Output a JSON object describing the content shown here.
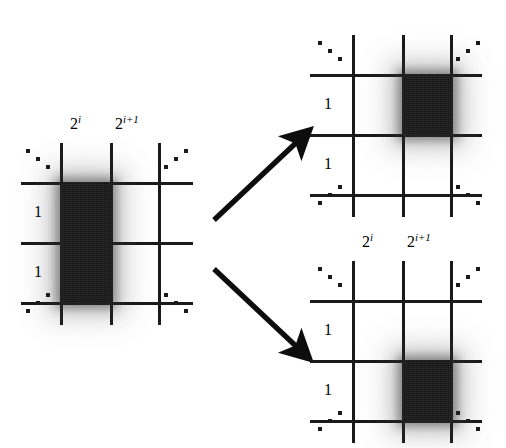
{
  "figure": {
    "background_color": "#ffffff",
    "ink_color": "#1a1a1a",
    "block_color": "#151515"
  },
  "panels": [
    {
      "id": "source-grid",
      "name": "left-grid",
      "column_labels": [
        {
          "base": "2",
          "exp": "i"
        },
        {
          "base": "2",
          "exp": "i+1"
        }
      ],
      "row_labels": [
        "1",
        "1"
      ],
      "block": {
        "label": "tall-dark-block",
        "spans_rows": 2,
        "spans_columns": 1,
        "column_index": 1,
        "row_index": 1
      },
      "ellipsis_corners": [
        "top-left",
        "top-right",
        "bottom-left",
        "bottom-right"
      ]
    },
    {
      "id": "target-grid-top",
      "name": "top-right-grid",
      "column_labels": [],
      "row_labels": [
        "1",
        "1"
      ],
      "block": {
        "label": "square-dark-block",
        "spans_rows": 1,
        "spans_columns": 1,
        "column_index": 2,
        "row_index": 1
      },
      "ellipsis_corners": [
        "top-left",
        "top-right",
        "bottom-left",
        "bottom-right"
      ]
    },
    {
      "id": "target-grid-bottom",
      "name": "bottom-right-grid",
      "column_labels": [
        {
          "base": "2",
          "exp": "i"
        },
        {
          "base": "2",
          "exp": "i+1"
        }
      ],
      "row_labels": [
        "1",
        "1"
      ],
      "block": {
        "label": "square-dark-block",
        "spans_rows": 1,
        "spans_columns": 1,
        "column_index": 2,
        "row_index": 2
      },
      "ellipsis_corners": [
        "top-left",
        "top-right",
        "bottom-left",
        "bottom-right"
      ]
    }
  ],
  "arrows": [
    {
      "id": "arrow-up",
      "name": "arrow-to-top-right-grid",
      "direction": "up-right"
    },
    {
      "id": "arrow-down",
      "name": "arrow-to-bottom-right-grid",
      "direction": "down-right"
    }
  ],
  "labels": {
    "one": "1",
    "two": "2",
    "exp_i": "i",
    "exp_i_plus_1": "i+1"
  }
}
